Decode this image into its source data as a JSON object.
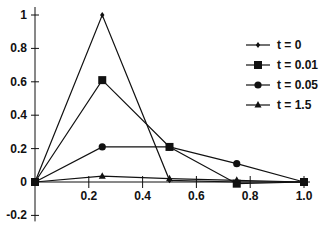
{
  "chart_data": {
    "type": "line",
    "title": "",
    "xlabel": "",
    "ylabel": "",
    "xlim": [
      0,
      1.0
    ],
    "ylim": [
      -0.2,
      1.0
    ],
    "grid": false,
    "legend_position": "right-center",
    "x": [
      0,
      0.25,
      0.5,
      0.75,
      1.0
    ],
    "xticks": [
      0.2,
      0.4,
      0.6,
      0.8,
      1.0
    ],
    "xtick_labels": [
      "0.2",
      "0.4",
      "0.6",
      "0.8",
      "1.0"
    ],
    "yticks": [
      1,
      0.8,
      0.6,
      0.4,
      0.2,
      0,
      -0.2
    ],
    "ytick_labels": [
      "1",
      "0.8",
      "0.6",
      "0.4",
      "0.2",
      "0",
      "-0.2"
    ],
    "series": [
      {
        "name": "t = 0",
        "marker": "diamond-small",
        "values": [
          0,
          1.0,
          0.01,
          0,
          0
        ]
      },
      {
        "name": "t = 0.01",
        "marker": "square",
        "values": [
          0,
          0.61,
          0.21,
          -0.01,
          0
        ]
      },
      {
        "name": "t = 0.05",
        "marker": "circle",
        "values": [
          0,
          0.21,
          0.21,
          0.11,
          0
        ]
      },
      {
        "name": "t = 1.5",
        "marker": "triangle",
        "values": [
          0,
          0.035,
          0.02,
          0.01,
          0
        ]
      }
    ]
  },
  "colors": {
    "line": "#111111",
    "background": "#ffffff"
  }
}
